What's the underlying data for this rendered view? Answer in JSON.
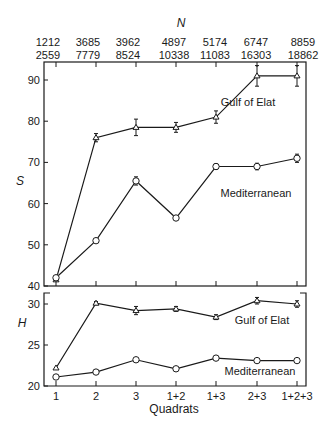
{
  "chart_data": [
    {
      "type": "line",
      "title": "",
      "xlabel": "",
      "ylabel": "S",
      "top_axis_label": "N",
      "categories": [
        "1",
        "2",
        "3",
        "1+2",
        "1+3",
        "2+3",
        "1+2+3"
      ],
      "top_tick_labels_row1": [
        "1212",
        "3685",
        "3962",
        "4897",
        "5174",
        "6747",
        "8859"
      ],
      "top_tick_labels_row2": [
        "2559",
        "7779",
        "8524",
        "10338",
        "11083",
        "16303",
        "18862"
      ],
      "yticks": [
        40,
        50,
        60,
        70,
        80,
        90
      ],
      "ylim": [
        40,
        93
      ],
      "grid": false,
      "series": [
        {
          "name": "Gulf of Elat",
          "marker": "triangle",
          "values": [
            41.5,
            76,
            78.5,
            78.5,
            81,
            91,
            91
          ]
        },
        {
          "name": "Mediterranean",
          "marker": "circle",
          "values": [
            42,
            51,
            65.5,
            56.5,
            69,
            69,
            71
          ]
        }
      ]
    },
    {
      "type": "line",
      "title": "",
      "xlabel": "Quadrats",
      "ylabel": "H",
      "categories": [
        "1",
        "2",
        "3",
        "1+2",
        "1+3",
        "2+3",
        "1+2+3"
      ],
      "yticks": [
        20,
        25,
        30
      ],
      "ylim": [
        20,
        31.5
      ],
      "grid": false,
      "series": [
        {
          "name": "Gulf of Elat",
          "marker": "triangle",
          "values": [
            22.2,
            30.1,
            29.2,
            29.4,
            28.4,
            30.4,
            30.0
          ]
        },
        {
          "name": "Mediterranean",
          "marker": "circle",
          "values": [
            21.1,
            21.7,
            23.2,
            22.1,
            23.4,
            23.1,
            23.1
          ]
        }
      ]
    }
  ],
  "labels": {
    "n_axis": "N",
    "s_axis": "S",
    "h_axis": "H",
    "x_axis": "Quadrats",
    "upper_gulf": "Gulf of Elat",
    "upper_med": "Mediterranean",
    "lower_gulf": "Gulf of Elat",
    "lower_med": "Mediterranean"
  }
}
